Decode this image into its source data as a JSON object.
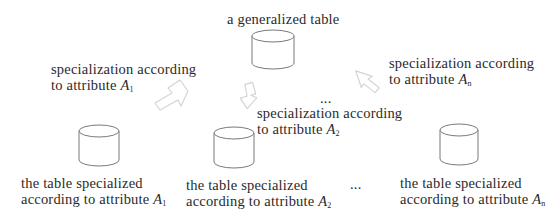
{
  "diagram": {
    "root": {
      "label": "a generalized table"
    },
    "edges": [
      {
        "line1": "specialization according",
        "line2_prefix": "to attribute ",
        "attr": "A",
        "sub": "1"
      },
      {
        "line1": "specialization according",
        "line2_prefix": "to attribute ",
        "attr": "A",
        "sub": "2"
      },
      {
        "line1": "specialization according",
        "line2_prefix": "to attribute ",
        "attr": "A",
        "sub": "n"
      }
    ],
    "ellipsis_middle": "...",
    "children": [
      {
        "line1": "the table specialized",
        "line2_prefix": "according to attribute ",
        "attr": "A",
        "sub": "1"
      },
      {
        "line1": "the table specialized",
        "line2_prefix": "according to attribute ",
        "attr": "A",
        "sub": "2"
      },
      {
        "line1": "the table specialized",
        "line2_prefix": "according to attribute ",
        "attr": "A",
        "sub": "n"
      }
    ],
    "ellipsis_bottom": "...",
    "colors": {
      "stroke": "#6a6a6a",
      "arrow": "#d8d8d8",
      "text": "#2a2a2a"
    }
  }
}
